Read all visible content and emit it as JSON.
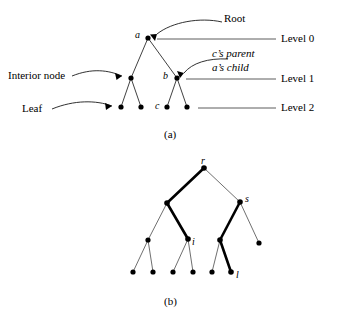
{
  "figure": {
    "background": "#ffffff",
    "ink": "#000000",
    "thin_stroke": "#3a3a3a"
  },
  "panel_a": {
    "caption": "(a)",
    "node_labels": {
      "root": "a",
      "interior_right": "b",
      "leaf_c": "c"
    },
    "annotations": [
      {
        "name": "root",
        "text": "Root"
      },
      {
        "name": "interior-node",
        "text": "Interior node"
      },
      {
        "name": "leaf",
        "text": "Leaf"
      },
      {
        "name": "c-parent",
        "text": "c’s parent"
      },
      {
        "name": "a-child",
        "text": "a’s child"
      }
    ],
    "levels": [
      {
        "name": "level-0",
        "text": "Level 0"
      },
      {
        "name": "level-1",
        "text": "Level 1"
      },
      {
        "name": "level-2",
        "text": "Level 2"
      }
    ],
    "nodes": [
      {
        "id": "a",
        "x": 148,
        "y": 38,
        "level": 0
      },
      {
        "id": "n1",
        "x": 131,
        "y": 78,
        "level": 1
      },
      {
        "id": "b",
        "x": 177,
        "y": 78,
        "level": 1
      },
      {
        "id": "l1",
        "x": 121,
        "y": 107,
        "level": 2
      },
      {
        "id": "l2",
        "x": 141,
        "y": 107,
        "level": 2
      },
      {
        "id": "c",
        "x": 167,
        "y": 107,
        "level": 2
      },
      {
        "id": "l4",
        "x": 187,
        "y": 107,
        "level": 2
      }
    ],
    "edges": [
      [
        "a",
        "n1"
      ],
      [
        "a",
        "b"
      ],
      [
        "n1",
        "l1"
      ],
      [
        "n1",
        "l2"
      ],
      [
        "b",
        "c"
      ],
      [
        "b",
        "l4"
      ]
    ],
    "level_lines": [
      {
        "level": 0,
        "x1": 157,
        "x2": 276,
        "y": 39
      },
      {
        "level": 1,
        "x1": 186,
        "x2": 276,
        "y": 79
      },
      {
        "level": 2,
        "x1": 198,
        "x2": 276,
        "y": 108
      }
    ]
  },
  "panel_b": {
    "caption": "(b)",
    "node_labels": {
      "root": "r",
      "right_child": "s",
      "interior": "i",
      "leaf": "l"
    },
    "nodes": [
      {
        "id": "r",
        "x": 204,
        "y": 168,
        "depth": 0
      },
      {
        "id": "p",
        "x": 167,
        "y": 203,
        "depth": 1
      },
      {
        "id": "s",
        "x": 240,
        "y": 202,
        "depth": 1
      },
      {
        "id": "q",
        "x": 148,
        "y": 240,
        "depth": 2
      },
      {
        "id": "i",
        "x": 188,
        "y": 239,
        "depth": 2
      },
      {
        "id": "u",
        "x": 220,
        "y": 240,
        "depth": 2
      },
      {
        "id": "v",
        "x": 259,
        "y": 243,
        "depth": 2
      },
      {
        "id": "f1",
        "x": 133,
        "y": 272,
        "depth": 3
      },
      {
        "id": "f2",
        "x": 153,
        "y": 272,
        "depth": 3
      },
      {
        "id": "f3",
        "x": 173,
        "y": 272,
        "depth": 3
      },
      {
        "id": "f4",
        "x": 193,
        "y": 272,
        "depth": 3
      },
      {
        "id": "f5",
        "x": 212,
        "y": 272,
        "depth": 3
      },
      {
        "id": "l",
        "x": 231,
        "y": 272,
        "depth": 3
      }
    ],
    "edges": [
      {
        "from": "r",
        "to": "p",
        "bold": true
      },
      {
        "from": "r",
        "to": "s",
        "bold": false
      },
      {
        "from": "p",
        "to": "q",
        "bold": false
      },
      {
        "from": "p",
        "to": "i",
        "bold": true
      },
      {
        "from": "s",
        "to": "u",
        "bold": true
      },
      {
        "from": "s",
        "to": "v",
        "bold": false
      },
      {
        "from": "q",
        "to": "f1",
        "bold": false
      },
      {
        "from": "q",
        "to": "f2",
        "bold": false
      },
      {
        "from": "i",
        "to": "f3",
        "bold": false
      },
      {
        "from": "i",
        "to": "f4",
        "bold": false
      },
      {
        "from": "u",
        "to": "f5",
        "bold": false
      },
      {
        "from": "u",
        "to": "l",
        "bold": true
      }
    ]
  }
}
